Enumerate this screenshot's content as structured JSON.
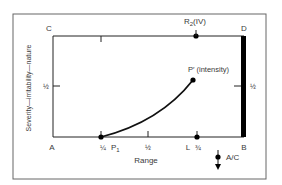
{
  "diagram": {
    "corners": {
      "top_left": "C",
      "top_right": "D",
      "bottom_left": "A",
      "bottom_right": "B"
    },
    "y_axis_label": "Severity—irritability—nature",
    "x_axis_label": "Range",
    "half_left": "½",
    "half_right": "½",
    "x_ticks": [
      {
        "label": "¼",
        "point_label": "P",
        "subscript": "1"
      },
      {
        "label": "½"
      },
      {
        "label": "¾",
        "pre_label": "L"
      }
    ],
    "top_point": {
      "label": "R",
      "subscript": "2",
      "suffix": "(IV)"
    },
    "curve_end_point": {
      "label": "P′ (intensity)"
    },
    "arrow_label": "A/C",
    "colors": {
      "line": "#1a1a1a",
      "text": "#3a3a3a",
      "frame": "#555555"
    }
  }
}
